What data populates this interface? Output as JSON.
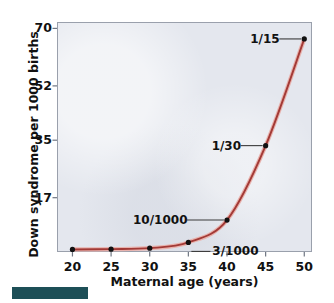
{
  "figure": {
    "background_color": "#ffffff",
    "plot_background_color": "#e4e7ee",
    "curve_color": "#a33a36",
    "marker_color": "#111111",
    "accent_bar_color": "#1d4f57"
  },
  "chart_data": {
    "type": "line",
    "title": "",
    "xlabel": "Maternal age (years)",
    "ylabel": "Down syndrome per 1000 births",
    "xlim": [
      18,
      51
    ],
    "ylim": [
      0,
      72
    ],
    "grid": false,
    "legend": "none",
    "xticks": [
      20,
      25,
      30,
      35,
      40,
      45,
      50
    ],
    "xtick_labels": [
      "20",
      "25",
      "30",
      "35",
      "40",
      "45",
      "50"
    ],
    "yticks": [
      17,
      35,
      52,
      70
    ],
    "ytick_labels": [
      "17",
      "35",
      "52",
      "70"
    ],
    "x": [
      20,
      25,
      30,
      35,
      40,
      45,
      50
    ],
    "values": [
      0.8,
      0.9,
      1.2,
      3.0,
      10.0,
      33.3,
      66.7
    ],
    "series": [
      {
        "name": "Down syndrome incidence",
        "x": [
          20,
          25,
          30,
          35,
          40,
          45,
          50
        ],
        "values": [
          0.8,
          0.9,
          1.2,
          3.0,
          10.0,
          33.3,
          66.7
        ]
      }
    ],
    "annotations": [
      {
        "label": "1/15",
        "x": 50,
        "y": 66.7
      },
      {
        "label": "1/30",
        "x": 45,
        "y": 33.3
      },
      {
        "label": "10/1000",
        "x": 40,
        "y": 10.0
      },
      {
        "label": "3/1000",
        "x": 35,
        "y": 3.0
      }
    ]
  }
}
